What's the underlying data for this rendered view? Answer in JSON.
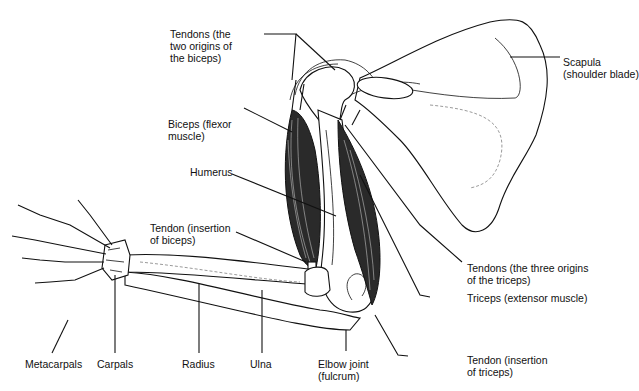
{
  "diagram": {
    "labels": {
      "tendons_biceps_origin": "Tendons (the\ntwo origins of\nthe biceps)",
      "scapula": "Scapula\n(shoulder blade)",
      "biceps": "Biceps (flexor\nmuscle)",
      "humerus": "Humerus",
      "tendon_biceps_insertion": "Tendon (insertion\nof biceps)",
      "tendons_triceps_origin": "Tendons (the three origins\nof the triceps)",
      "triceps": "Triceps (extensor muscle)",
      "metacarpals": "Metacarpals",
      "carpals": "Carpals",
      "radius": "Radius",
      "ulna": "Ulna",
      "elbow_joint": "Elbow joint\n(fulcrum)",
      "tendon_triceps_insertion": "Tendon (insertion\nof triceps)"
    },
    "colors": {
      "ink": "#111111",
      "background": "#ffffff",
      "muscle": "#2a2a2a"
    }
  }
}
